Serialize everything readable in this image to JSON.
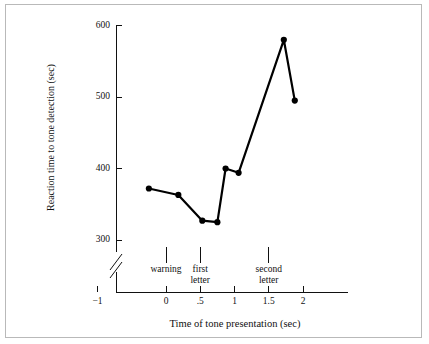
{
  "chart_data": {
    "type": "line",
    "title": "",
    "xlabel": "Time of tone presentation (sec)",
    "ylabel": "Reaction time to tone detection (sec)",
    "xlim": [
      -1.35,
      2.25
    ],
    "ylim": [
      300,
      600
    ],
    "yaxis_break": true,
    "grid": false,
    "legend": null,
    "xticks": [
      -1,
      0,
      0.5,
      1,
      1.5,
      2
    ],
    "xtick_labels": [
      "−1",
      "0",
      ".5",
      "1",
      "1.5",
      "2"
    ],
    "yticks": [
      300,
      400,
      500,
      600
    ],
    "ytick_labels": [
      "300",
      "400",
      "500",
      "600"
    ],
    "series": [
      {
        "name": "Reaction time",
        "marker": "filled-circle",
        "color": "#000000",
        "x": [
          -0.25,
          0.18,
          0.53,
          0.75,
          0.87,
          1.06,
          1.72,
          1.88
        ],
        "y": [
          372,
          363,
          327,
          325,
          400,
          394,
          580,
          495
        ]
      }
    ],
    "annotations": [
      {
        "label": "warning",
        "x": 0
      },
      {
        "label": "first\nletter",
        "x": 0.5
      },
      {
        "label": "second\nletter",
        "x": 1.5
      }
    ]
  },
  "figure": {
    "background_color": "#ffffff",
    "frame_color": "#b9b9b9",
    "line_color": "#000000"
  }
}
